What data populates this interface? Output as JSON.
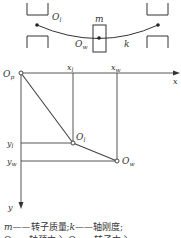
{
  "schematic": {
    "mass_label": "m",
    "stiffness_label": "k",
    "left_point_label": "O",
    "left_point_sub": "l",
    "center_point_label": "O",
    "center_point_sub": "w"
  },
  "coordinate_diagram": {
    "origin_label": "O",
    "origin_sub": "p",
    "x_axis_label": "x",
    "y_axis_label": "y",
    "x_ticks": [
      {
        "label": "x",
        "sub": "l"
      },
      {
        "label": "x",
        "sub": "w"
      }
    ],
    "y_ticks": [
      {
        "label": "y",
        "sub": "l"
      },
      {
        "label": "y",
        "sub": "w"
      }
    ],
    "point_l": {
      "label": "O",
      "sub": "l"
    },
    "point_w": {
      "label": "O",
      "sub": "w"
    }
  },
  "caption": {
    "line1_sym1": "m",
    "line1_text1": "——转子质量;",
    "line1_sym2": "k",
    "line1_text2": "——轴刚度;",
    "line2_partial": "O——轴颈中心;O——转子中心"
  },
  "colors": {
    "line": "#333333",
    "background": "#ffffff"
  }
}
